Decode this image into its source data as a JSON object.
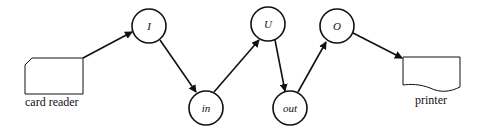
{
  "diagram": {
    "devices": {
      "card_reader": {
        "label": "card reader"
      },
      "printer": {
        "label": "printer"
      }
    },
    "nodes": [
      {
        "id": "I",
        "label": "I"
      },
      {
        "id": "in",
        "label": "in"
      },
      {
        "id": "U",
        "label": "U"
      },
      {
        "id": "out",
        "label": "out"
      },
      {
        "id": "O",
        "label": "O"
      }
    ],
    "edges": [
      {
        "from": "card reader",
        "to": "I"
      },
      {
        "from": "I",
        "to": "in"
      },
      {
        "from": "in",
        "to": "U"
      },
      {
        "from": "U",
        "to": "out"
      },
      {
        "from": "out",
        "to": "O"
      },
      {
        "from": "O",
        "to": "printer"
      }
    ],
    "colors": {
      "line": "#111111",
      "background": "#ffffff"
    }
  }
}
